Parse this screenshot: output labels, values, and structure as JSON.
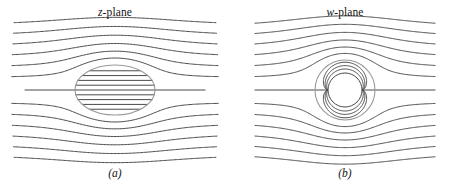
{
  "figure": {
    "kind": "conformal-map-streamline-diagram",
    "background_color": "#ffffff",
    "width": 460,
    "height": 183
  },
  "style": {
    "streamline_color": "#4a4a4a",
    "streamline_width": 1.0,
    "body_outline_color": "#9a9a9a",
    "body_outline_width": 1.1,
    "text_color": "#141414"
  },
  "panels": [
    {
      "id": "a",
      "title_var": "z",
      "title_rest": "-plane",
      "title_full": "z-plane",
      "caption": "(a)",
      "body": {
        "shape": "ellipse",
        "cx": 115,
        "cy": 90,
        "rx": 40,
        "ry": 25,
        "interior_lines": "horizontal-straight"
      },
      "field": {
        "x_start": 25,
        "x_end": 205,
        "n_streamlines": 13,
        "y_levels": [
          28,
          38,
          48,
          58,
          68,
          78,
          90,
          102,
          112,
          122,
          132,
          142,
          152
        ]
      }
    },
    {
      "id": "b",
      "title_var": "w",
      "title_rest": "-plane",
      "title_full": "w-plane",
      "caption": "(b)",
      "body": {
        "shape": "circle",
        "cx": 115,
        "cy": 90,
        "r": 30,
        "inner_circle_r": 17,
        "interior_lines": "wrapped-around-inner-circle"
      },
      "field": {
        "x_start": 25,
        "x_end": 205,
        "n_streamlines": 13,
        "y_levels": [
          28,
          38,
          48,
          58,
          68,
          78,
          90,
          102,
          112,
          122,
          132,
          142,
          152
        ]
      }
    }
  ],
  "chart_data": {
    "type": "line",
    "title": "",
    "xlabel": "",
    "ylabel": "",
    "series": [
      {
        "name": "z-plane streamlines",
        "count": 13
      },
      {
        "name": "w-plane streamlines",
        "count": 13
      }
    ]
  }
}
